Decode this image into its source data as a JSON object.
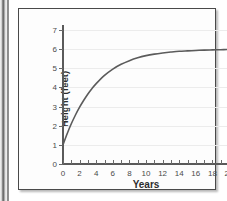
{
  "figure": {
    "frame_color": "#4a4a4a",
    "background_color": "#fdfdfd"
  },
  "chart_data": {
    "type": "line",
    "title": "",
    "xlabel": "Years",
    "ylabel": "Height (feet)",
    "xlim": [
      0,
      20
    ],
    "ylim": [
      0,
      7
    ],
    "grid": true,
    "grid_axis": "y",
    "legend": null,
    "line_color": "#5b5b5b",
    "x_tick_labels": [
      "0",
      "2",
      "4",
      "6",
      "8",
      "10",
      "12",
      "14",
      "16",
      "18",
      "20"
    ],
    "x_tick_values": [
      0,
      2,
      4,
      6,
      8,
      10,
      12,
      14,
      16,
      18,
      20
    ],
    "x_minor_tick_values": [
      0,
      1,
      2,
      3,
      4,
      5,
      6,
      7,
      8,
      9,
      10,
      11,
      12,
      13,
      14,
      15,
      16,
      17,
      18,
      19,
      20
    ],
    "y_tick_labels": [
      "0",
      "1",
      "2",
      "3",
      "4",
      "5",
      "6",
      "7"
    ],
    "y_tick_values": [
      0,
      1,
      2,
      3,
      4,
      5,
      6,
      7
    ],
    "series": [
      {
        "name": "Height",
        "x": [
          0,
          0.5,
          1,
          1.5,
          2,
          2.5,
          3,
          3.5,
          4,
          5,
          6,
          7,
          8,
          9,
          10,
          11,
          12,
          13,
          14,
          15,
          16,
          17,
          18,
          19,
          20
        ],
        "y": [
          1.0,
          1.58,
          2.1,
          2.56,
          2.97,
          3.33,
          3.66,
          3.95,
          4.2,
          4.63,
          4.96,
          5.21,
          5.4,
          5.55,
          5.66,
          5.74,
          5.8,
          5.85,
          5.89,
          5.91,
          5.93,
          5.95,
          5.96,
          5.97,
          5.98
        ]
      }
    ],
    "asymptote": 6,
    "start_value": 1
  }
}
